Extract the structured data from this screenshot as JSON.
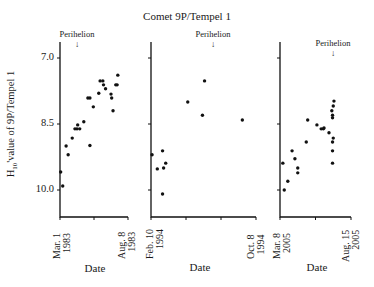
{
  "chart_data": {
    "type": "scatter",
    "title": "Comet 9P/Tempel 1",
    "ylabel": "H10 value of 9P/Tempel 1",
    "y_axis": {
      "inverted": true,
      "ticks": [
        7.0,
        8.5,
        10.0
      ],
      "ylim": [
        6.6,
        10.6
      ]
    },
    "panels": [
      {
        "xlabel": "Date",
        "x_start": "Mar. 1 1983",
        "x_end": "Aug. 8 1983",
        "annotation": "Perihelion",
        "perihelion_pos": 0.5,
        "points": [
          {
            "x": 0.01,
            "y": 9.59
          },
          {
            "x": 0.04,
            "y": 9.91
          },
          {
            "x": 0.09,
            "y": 9.0
          },
          {
            "x": 0.12,
            "y": 9.2
          },
          {
            "x": 0.18,
            "y": 8.82
          },
          {
            "x": 0.22,
            "y": 8.61
          },
          {
            "x": 0.25,
            "y": 8.61
          },
          {
            "x": 0.26,
            "y": 8.52
          },
          {
            "x": 0.29,
            "y": 8.61
          },
          {
            "x": 0.35,
            "y": 8.45
          },
          {
            "x": 0.44,
            "y": 8.99
          },
          {
            "x": 0.41,
            "y": 7.91
          },
          {
            "x": 0.44,
            "y": 7.91
          },
          {
            "x": 0.49,
            "y": 8.11
          },
          {
            "x": 0.57,
            "y": 7.8
          },
          {
            "x": 0.59,
            "y": 7.52
          },
          {
            "x": 0.63,
            "y": 7.52
          },
          {
            "x": 0.64,
            "y": 7.61
          },
          {
            "x": 0.67,
            "y": 7.7
          },
          {
            "x": 0.75,
            "y": 7.82
          },
          {
            "x": 0.76,
            "y": 7.91
          },
          {
            "x": 0.78,
            "y": 8.2
          },
          {
            "x": 0.82,
            "y": 7.61
          },
          {
            "x": 0.84,
            "y": 7.61
          },
          {
            "x": 0.85,
            "y": 7.39
          }
        ]
      },
      {
        "xlabel": "Date",
        "x_start": "Feb. 10 1994",
        "x_end": "Oct. 8 1994",
        "annotation": "Perihelion",
        "perihelion_pos": 0.5,
        "points": [
          {
            "x": 0.01,
            "y": 9.2
          },
          {
            "x": 0.06,
            "y": 9.52
          },
          {
            "x": 0.11,
            "y": 9.11
          },
          {
            "x": 0.12,
            "y": 9.5
          },
          {
            "x": 0.14,
            "y": 9.39
          },
          {
            "x": 0.11,
            "y": 10.09
          },
          {
            "x": 0.35,
            "y": 8.0
          },
          {
            "x": 0.49,
            "y": 8.3
          },
          {
            "x": 0.51,
            "y": 7.52
          },
          {
            "x": 0.87,
            "y": 8.41
          }
        ]
      },
      {
        "xlabel": "Date",
        "x_start": "Mar. 8 2005",
        "x_end": "Aug. 15 2005",
        "annotation": "Perihelion",
        "perihelion_pos": 0.75,
        "points": [
          {
            "x": 0.04,
            "y": 9.39
          },
          {
            "x": 0.06,
            "y": 10.0
          },
          {
            "x": 0.11,
            "y": 9.8
          },
          {
            "x": 0.17,
            "y": 9.11
          },
          {
            "x": 0.21,
            "y": 9.29
          },
          {
            "x": 0.25,
            "y": 9.5
          },
          {
            "x": 0.25,
            "y": 9.61
          },
          {
            "x": 0.37,
            "y": 8.91
          },
          {
            "x": 0.39,
            "y": 8.41
          },
          {
            "x": 0.52,
            "y": 8.52
          },
          {
            "x": 0.58,
            "y": 8.61
          },
          {
            "x": 0.61,
            "y": 8.61
          },
          {
            "x": 0.62,
            "y": 8.59
          },
          {
            "x": 0.69,
            "y": 8.7
          },
          {
            "x": 0.73,
            "y": 8.2
          },
          {
            "x": 0.75,
            "y": 8.09
          },
          {
            "x": 0.74,
            "y": 8.3
          },
          {
            "x": 0.74,
            "y": 8.36
          },
          {
            "x": 0.75,
            "y": 8.82
          },
          {
            "x": 0.74,
            "y": 8.91
          },
          {
            "x": 0.74,
            "y": 9.11
          },
          {
            "x": 0.74,
            "y": 9.39
          },
          {
            "x": 0.76,
            "y": 7.98
          }
        ]
      }
    ]
  },
  "labels": {
    "title": "Comet 9P/Tempel 1",
    "ylabel_main": "H",
    "ylabel_sub": "10",
    "ylabel_rest": "'value of 9P/Tempel 1",
    "yticks": [
      "7.0",
      "8.5",
      "10.0"
    ],
    "perihelion": "Perihelion",
    "arrow": "↓",
    "panels": [
      {
        "start": "Mar. 1\n1983",
        "end": "Aug. 8\n1983",
        "xlabel": "Date"
      },
      {
        "start": "Feb. 10\n1994",
        "end": "Oct. 8\n1994",
        "xlabel": "Date"
      },
      {
        "start": "Mar. 8\n2005",
        "end": "Aug. 15\n2005",
        "xlabel": "Date"
      }
    ]
  }
}
